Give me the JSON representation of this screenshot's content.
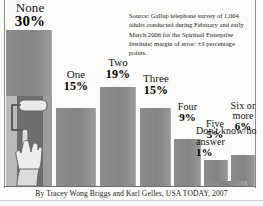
{
  "source_note": "Source: Gallup telephone survey of 1,004 adults conducted during February and early March 2006 for the Spiritual Enterprise Institute; margin of error: ±3 percentage points.",
  "credit": "By Tracey Wong Briggs and Karl Gelles, USA TODAY, 2007",
  "colors": {
    "bar": "#8a8a8a",
    "rule": "#8d8d8d",
    "text": "#1a1a1a",
    "background": "#fbfbfa"
  },
  "icons": {
    "paint_roller": "paint-roller-icon",
    "hand": "hand-icon"
  },
  "chart_data": {
    "type": "bar",
    "title": "",
    "xlabel": "",
    "ylabel": "",
    "ylim": [
      0,
      30
    ],
    "grid": false,
    "legend": "none",
    "categories": [
      "None",
      "One",
      "Two",
      "Three",
      "Four",
      "Five",
      "Six or more",
      "Don't know/no answer"
    ],
    "values": [
      30,
      15,
      19,
      15,
      9,
      5,
      6,
      1
    ],
    "value_labels": [
      "30%",
      "15%",
      "19%",
      "15%",
      "9%",
      "5%",
      "6%",
      "1%"
    ],
    "annotations": [
      "Source: Gallup telephone survey of 1,004 adults conducted during February and early March 2006 for the Spiritual Enterprise Institute; margin of error: ±3 percentage points."
    ]
  }
}
